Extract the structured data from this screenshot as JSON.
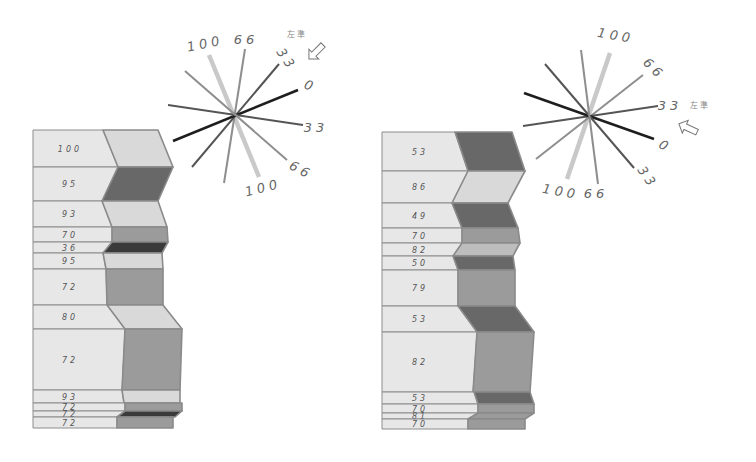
{
  "panels": [
    {
      "id": "left",
      "rows": [
        {
          "label": "100",
          "tone": "light"
        },
        {
          "label": "95",
          "tone": "dark"
        },
        {
          "label": "93",
          "tone": "light"
        },
        {
          "label": "70",
          "tone": "medium"
        },
        {
          "label": "36",
          "tone": "darkest"
        },
        {
          "label": "95",
          "tone": "light"
        },
        {
          "label": "72",
          "tone": "medium"
        },
        {
          "label": "80",
          "tone": "light"
        },
        {
          "label": "72",
          "tone": "medium"
        },
        {
          "label": "93",
          "tone": "light"
        },
        {
          "label": "72",
          "tone": "medium"
        },
        {
          "label": "72",
          "tone": "darkest"
        },
        {
          "label": "72",
          "tone": "medium"
        }
      ],
      "radial": {
        "lines": [
          {
            "value": "100",
            "tone": "pale"
          },
          {
            "value": "66",
            "tone": "mid"
          },
          {
            "value": "33",
            "tone": "dark"
          },
          {
            "value": "0",
            "tone": "black"
          },
          {
            "value": "33",
            "tone": "dark"
          },
          {
            "value": "66",
            "tone": "mid"
          }
        ],
        "labels": [
          "100",
          "66",
          "33",
          "0",
          "33",
          "66",
          "100"
        ],
        "legend_label": "左準",
        "legend_icon": "hollow-arrow-icon"
      }
    },
    {
      "id": "right",
      "rows": [
        {
          "label": "53",
          "tone": "dark"
        },
        {
          "label": "86",
          "tone": "light"
        },
        {
          "label": "49",
          "tone": "dark"
        },
        {
          "label": "70",
          "tone": "medium"
        },
        {
          "label": "82",
          "tone": "lightmedium"
        },
        {
          "label": "50",
          "tone": "dark"
        },
        {
          "label": "79",
          "tone": "medium"
        },
        {
          "label": "53",
          "tone": "dark"
        },
        {
          "label": "82",
          "tone": "medium"
        },
        {
          "label": "53",
          "tone": "dark"
        },
        {
          "label": "70",
          "tone": "medium"
        },
        {
          "label": "81",
          "tone": "medium"
        },
        {
          "label": "70",
          "tone": "medium"
        }
      ],
      "radial": {
        "lines": [
          {
            "value": "100",
            "tone": "pale"
          },
          {
            "value": "66",
            "tone": "mid"
          },
          {
            "value": "33",
            "tone": "dark"
          },
          {
            "value": "0",
            "tone": "black"
          },
          {
            "value": "33",
            "tone": "dark"
          },
          {
            "value": "66",
            "tone": "mid"
          }
        ],
        "labels": [
          "100",
          "66",
          "33",
          "0",
          "33",
          "100",
          "66"
        ],
        "legend_label": "左準",
        "legend_icon": "hollow-arrow-icon"
      }
    }
  ],
  "colors": {
    "cell_fill": "#e7e7e7",
    "cell_border": "#8c8c8c",
    "ribbon_border": "#8a8a8a",
    "tones": {
      "light": "#d9d9d9",
      "lightmedium": "#bdbdbd",
      "medium": "#9b9b9b",
      "dark": "#686868",
      "darkest": "#3a3a3a"
    },
    "line_tones": {
      "pale": "#c9c9c9",
      "mid": "#8e8e8e",
      "dark": "#555555",
      "black": "#1e1e1e"
    }
  }
}
